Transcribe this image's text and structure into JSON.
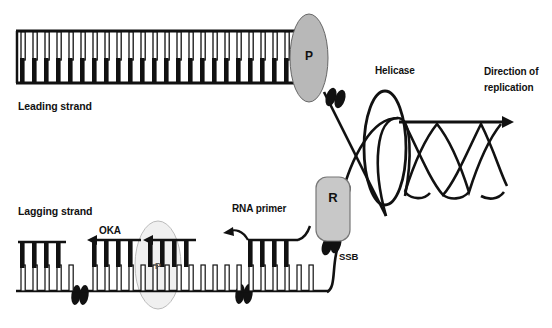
{
  "diagram": {
    "labels": {
      "leading_strand": "Leading strand",
      "lagging_strand": "Lagging strand",
      "okazaki": "OKA",
      "rna_primer": "RNA primer",
      "ssb": "SSB",
      "helicase": "Helicase",
      "direction_line1": "Direction of",
      "direction_line2": "replication"
    },
    "proteins": {
      "polymerase_leading": "P",
      "polymerase_lagging": "P",
      "primase": "R"
    },
    "colors": {
      "stroke": "#111111",
      "base_filled": "#111111",
      "base_hollow": "#ffffff",
      "polymerase_fill": "#b8b8b8",
      "polymerase_faint_fill": "#eeeeee",
      "primase_fill": "#c8c8c8",
      "ssb_fill": "#111111",
      "background": "#ffffff"
    },
    "structures": {
      "leading_strand": {
        "type": "double-stranded-dna",
        "top_backbone_y": 31,
        "bottom_backbone_y": 83,
        "x_start": 16,
        "x_end": 300,
        "base_pair_count": 23,
        "top_bases": "hollow",
        "bottom_bases": "filled"
      },
      "lagging_strand": {
        "type": "template-with-okazaki-fragments",
        "backbone_y": 291,
        "x_start": 16,
        "x_end": 327,
        "template_bases": "hollow",
        "fragment_bases": "filled",
        "okazaki_fragment_count": 4,
        "fragment_arrow_direction": "leftward"
      },
      "helicase": {
        "shape": "ellipse-outline",
        "cx": 385,
        "cy": 148,
        "rx": 21,
        "ry": 57
      },
      "polymerase_leading_ellipse": {
        "shape": "ellipse-filled",
        "cx": 309,
        "cy": 58,
        "rx": 19,
        "ry": 44
      },
      "polymerase_lagging_ellipse": {
        "shape": "ellipse-faint",
        "cx": 158,
        "cy": 265,
        "rx": 23,
        "ry": 44
      },
      "primase_box": {
        "shape": "rounded-rect",
        "x": 316,
        "y": 177,
        "w": 34,
        "h": 64
      },
      "ssb_pairs": [
        {
          "cx": 333,
          "cy": 196
        },
        {
          "cx": 331,
          "cy": 244
        },
        {
          "cx": 335,
          "cy": 97
        },
        {
          "cx": 79,
          "cy": 295
        },
        {
          "cx": 243,
          "cy": 294
        }
      ],
      "double_helix": {
        "x_start": 405,
        "x_end": 508,
        "top_y": 122,
        "bottom_y": 196,
        "crossings": 4,
        "arrow_at": "right"
      }
    }
  }
}
